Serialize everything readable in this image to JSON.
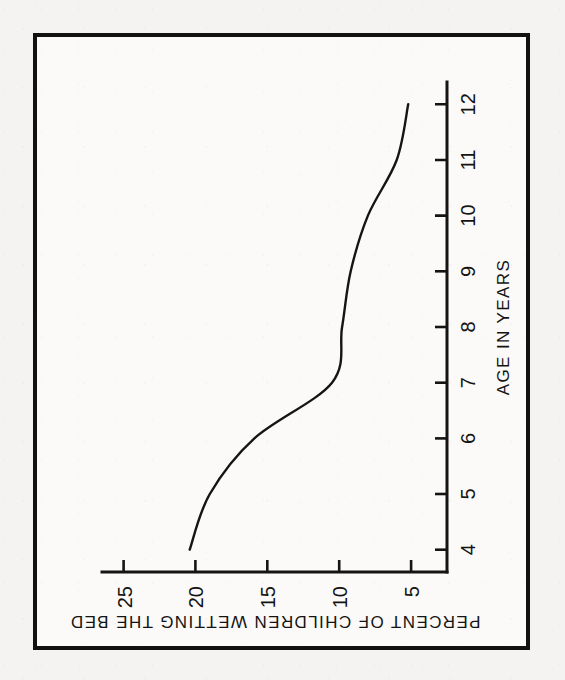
{
  "figure": {
    "orientation_note": "sideways-scan",
    "border_color": "#111111",
    "background_color": "#f4f3f1",
    "ink_color": "#141414"
  },
  "chart_data": {
    "type": "line",
    "title": "",
    "xlabel": "AGE IN YEARS",
    "ylabel": "PERCENT OF CHILDREN WETTING THE BED",
    "x": [
      4,
      5,
      6,
      7,
      8,
      9,
      10,
      11,
      12
    ],
    "values": [
      20.4,
      19.0,
      15.9,
      10.5,
      9.8,
      9.2,
      8.0,
      6.0,
      5.2
    ],
    "series": [
      {
        "name": "PERCENT OF CHILDREN WETTING THE BED",
        "values": [
          20.4,
          19.0,
          15.9,
          10.5,
          9.8,
          9.2,
          8.0,
          6.0,
          5.2
        ]
      }
    ],
    "xlim": [
      3.6,
      12.4
    ],
    "ylim": [
      2.5,
      26.5
    ],
    "xticks": [
      4,
      5,
      6,
      7,
      8,
      9,
      10,
      11,
      12
    ],
    "xticklabels": [
      "4",
      "5",
      "6",
      "7",
      "8",
      "9",
      "10",
      "11",
      "12"
    ],
    "yticks": [
      5,
      10,
      15,
      20,
      25
    ],
    "yticklabels": [
      "5",
      "10",
      "15",
      "20",
      "25"
    ],
    "grid": false,
    "legend": false,
    "legend_position": "none",
    "line_color": "#151515"
  }
}
